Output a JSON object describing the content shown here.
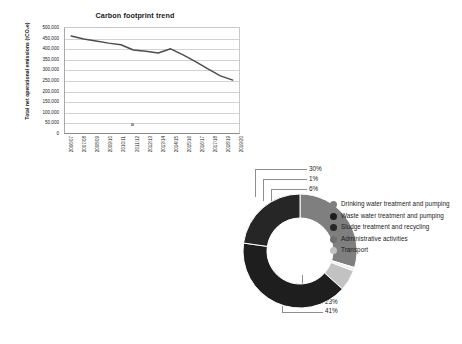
{
  "line_chart": {
    "title": "Carbon footprint trend",
    "ylabel": "Total net operational emissions (tCO₂e)",
    "ylabels": [
      "500,000",
      "450,000",
      "400,000",
      "350,000",
      "300,000",
      "250,000",
      "200,000",
      "150,000",
      "100,000",
      "50,000",
      "0"
    ],
    "xlabels": [
      "2006/07",
      "2007/08",
      "2008/09",
      "2009/10",
      "2010/11",
      "2011/12",
      "2012/13",
      "2013/14",
      "2014/15",
      "2015/16",
      "2016/17",
      "2017/18",
      "2018/19",
      "2019/20"
    ]
  },
  "donut_chart": {
    "callouts": [
      {
        "label": "30%"
      },
      {
        "label": "1%"
      },
      {
        "label": "6%"
      },
      {
        "label": "23%"
      },
      {
        "label": "41%"
      }
    ],
    "legend": [
      {
        "label": "Drinking water treatment and pumping",
        "color": "#7f7f7f"
      },
      {
        "label": "Waste water treatment and pumping",
        "color": "#1e1e1e"
      },
      {
        "label": "Sludge treatment and recycling",
        "color": "#262626"
      },
      {
        "label": "Administrative activities",
        "color": "#6e6e6e"
      },
      {
        "label": "Transport",
        "color": "#c2c2c2"
      }
    ]
  },
  "chart_data": [
    {
      "type": "line",
      "title": "Carbon footprint trend",
      "xlabel": "",
      "ylabel": "Total net operational emissions (tCO₂e)",
      "ylim": [
        0,
        500000
      ],
      "ytick_step": 50000,
      "grid": true,
      "legend_position": "none",
      "categories": [
        "2006/07",
        "2007/08",
        "2008/09",
        "2009/10",
        "2010/11",
        "2011/12",
        "2012/13",
        "2013/14",
        "2014/15",
        "2015/16",
        "2016/17",
        "2017/18",
        "2018/19",
        "2019/20"
      ],
      "values": [
        462000,
        448000,
        438000,
        428000,
        420000,
        395000,
        389000,
        381000,
        401000,
        372000,
        340000,
        305000,
        272000,
        252000
      ]
    },
    {
      "type": "pie",
      "title": "",
      "variant": "donut",
      "legend_position": "right",
      "labels": [
        "Drinking water treatment and pumping",
        "Transport",
        "Administrative activities",
        "Waste water treatment and pumping",
        "Sludge treatment and recycling"
      ],
      "values": [
        30,
        1,
        6,
        41,
        23
      ],
      "display_labels": [
        "30%",
        "1%",
        "6%",
        "41%",
        "23%"
      ],
      "colors": [
        "#7f7f7f",
        "#efefef",
        "#c2c2c2",
        "#1e1e1e",
        "#262626"
      ]
    }
  ]
}
